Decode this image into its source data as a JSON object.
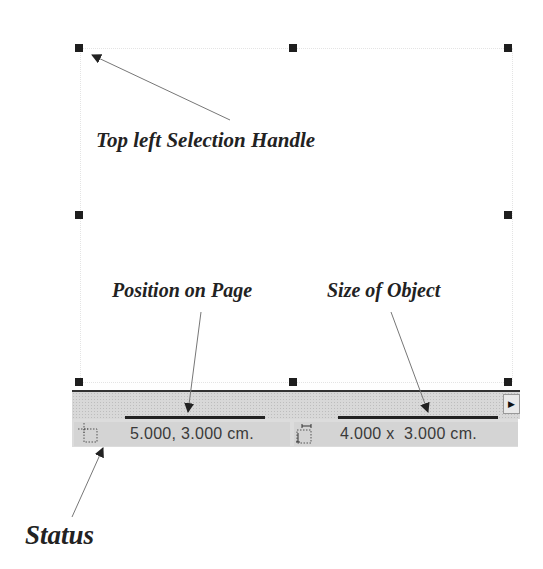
{
  "annotations": {
    "top_left_handle": "Top left Selection Handle",
    "position": "Position on Page",
    "size": "Size of Object",
    "status": "Status"
  },
  "statusbar": {
    "position_icon": "position-icon",
    "position_value": "5.000, 3.000 cm.",
    "size_icon": "size-icon",
    "size_value": "4.000 x  3.000 cm."
  },
  "scrollbar": {
    "right_arrow": "▶"
  },
  "colors": {
    "handle": "#1e1e1e",
    "statusbar_bg": "#d4d4d4",
    "caption_text": "#222222"
  }
}
